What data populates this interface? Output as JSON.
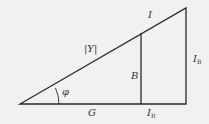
{
  "diagram": {
    "type": "admittance-triangle",
    "colors": {
      "background": "#f1f1f1",
      "stroke": "#2a2a2a",
      "text": "#333333"
    },
    "labels": {
      "hypotenuse_current": "I",
      "hypotenuse_admittance": "|Y|",
      "angle": "φ",
      "conductance": "G",
      "susceptance": "B",
      "resistive_current_main": "I",
      "resistive_current_sub": "R",
      "reactive_current_main": "I",
      "reactive_current_sub": "B"
    }
  }
}
